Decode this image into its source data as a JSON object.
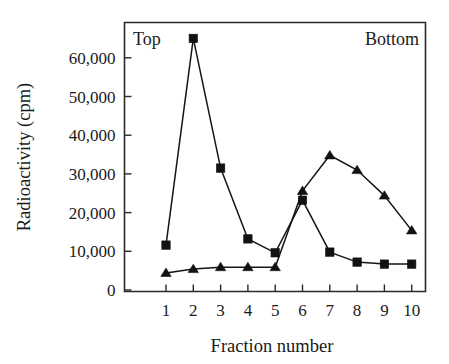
{
  "chart_data": {
    "type": "line",
    "title": "",
    "xlabel": "Fraction number",
    "ylabel": "Radioactivity (cpm)",
    "categories": [
      "1",
      "2",
      "3",
      "4",
      "5",
      "6",
      "7",
      "8",
      "9",
      "10"
    ],
    "x": [
      1,
      2,
      3,
      4,
      5,
      6,
      7,
      8,
      9,
      10
    ],
    "xlim": [
      0.6,
      10.4
    ],
    "ylim": [
      0,
      67000
    ],
    "grid": false,
    "legend_position": "none",
    "y_ticks": [
      0,
      10000,
      20000,
      30000,
      40000,
      50000,
      60000
    ],
    "y_tick_labels": [
      "0",
      "10,000",
      "20,000",
      "30,000",
      "40,000",
      "50,000",
      "60,000"
    ],
    "x_ticks": [
      1,
      2,
      3,
      4,
      5,
      6,
      7,
      8,
      9,
      10
    ],
    "x_tick_labels": [
      "1",
      "2",
      "3",
      "4",
      "5",
      "6",
      "7",
      "8",
      "9",
      "10"
    ],
    "series": [
      {
        "name": "square-series",
        "marker": "square",
        "values": [
          11600,
          65000,
          31500,
          13200,
          9600,
          23200,
          9800,
          7200,
          6700,
          6700
        ]
      },
      {
        "name": "triangle-series",
        "marker": "triangle",
        "values": [
          4400,
          5400,
          5900,
          5900,
          5900,
          25600,
          34800,
          31000,
          24400,
          15400
        ]
      }
    ],
    "annotations": [
      {
        "name": "top-label",
        "text": "Top",
        "position": "plot-top-left"
      },
      {
        "name": "bottom-label",
        "text": "Bottom",
        "position": "plot-top-right"
      }
    ],
    "colors": {
      "axis": "#2a2a2a",
      "series_square": "#121212",
      "series_triangle": "#121212",
      "background": "#ffffff"
    }
  }
}
